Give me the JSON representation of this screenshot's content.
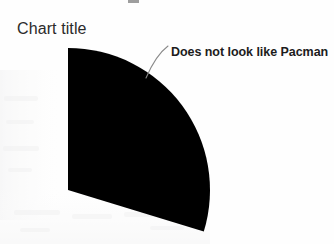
{
  "page": {
    "width": 334,
    "height": 244,
    "background_color": "#fefefe"
  },
  "chart": {
    "title": "Chart title",
    "annotation": {
      "text": "Does not look like Pacman",
      "leader_line_color": "#8a8a8a"
    },
    "slice_color": "#000000",
    "title_color": "#2b2b2b"
  },
  "chart_data": {
    "type": "pie",
    "title": "Chart title",
    "categories": [
      "Series 1",
      "Remainder"
    ],
    "values": [
      30,
      70
    ],
    "labels": [
      "Does not look like Pacman",
      ""
    ],
    "visible_slices": [
      {
        "name": "Series 1",
        "value": 30,
        "percent": 30,
        "color": "#000000",
        "start_angle_deg": 0,
        "end_angle_deg": 107,
        "rendered": true
      },
      {
        "name": "Remainder",
        "value": 70,
        "percent": 70,
        "color": "#ffffff",
        "start_angle_deg": 107,
        "end_angle_deg": 360,
        "rendered": false
      }
    ],
    "center": [
      68,
      190
    ],
    "radius": 142,
    "legend": "none",
    "grid": false,
    "xlabel": "",
    "ylabel": "",
    "annotations": [
      {
        "text": "Does not look like Pacman",
        "anchor_point": [
          146,
          78
        ],
        "text_point": [
          171,
          52
        ]
      }
    ]
  }
}
